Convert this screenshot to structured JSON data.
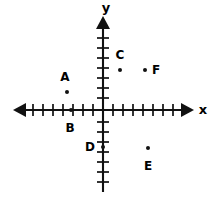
{
  "figure": {
    "type": "coordinate-plane",
    "background_color": "#ffffff",
    "ink_color": "#111111"
  },
  "axes": {
    "x_label": "x",
    "y_label": "y",
    "origin_px": [
      103,
      110
    ],
    "tick_spacing_px": 10,
    "x_range": [
      -8.5,
      9
    ],
    "y_range": [
      -8,
      9.5
    ],
    "grid": false,
    "tick_labels_shown": false,
    "arrowheads": "both-ends-both-axes"
  },
  "chart_data": {
    "type": "scatter",
    "title": "",
    "xlabel": "x",
    "ylabel": "y",
    "xlim": [
      -8.5,
      9
    ],
    "ylim": [
      -8,
      9.5
    ],
    "grid": false,
    "legend": "none",
    "point_labels": [
      "A",
      "B",
      "C",
      "D",
      "E",
      "F"
    ],
    "x": [
      -3.5,
      -3,
      2,
      0,
      4.5,
      4
    ],
    "y": [
      2,
      0,
      4,
      -3.5,
      -4,
      4
    ],
    "points": [
      {
        "label": "A",
        "x": -3.5,
        "y": 2,
        "px": 67,
        "py": 92,
        "label_px": 65,
        "label_py": 77
      },
      {
        "label": "B",
        "x": -3,
        "y": 0,
        "px": 71,
        "py": 110,
        "label_px": 70,
        "label_py": 128
      },
      {
        "label": "C",
        "x": 2,
        "y": 4,
        "px": 120,
        "py": 70,
        "label_px": 120,
        "label_py": 55
      },
      {
        "label": "D",
        "x": 0,
        "y": -3.5,
        "px": 103,
        "py": 147,
        "label_px": 90,
        "label_py": 147
      },
      {
        "label": "E",
        "x": 4.5,
        "y": -4,
        "px": 148,
        "py": 148,
        "label_px": 148,
        "label_py": 166
      },
      {
        "label": "F",
        "x": 4,
        "y": 4,
        "px": 145,
        "py": 70,
        "label_px": 156,
        "label_py": 70
      }
    ]
  },
  "axis_label_positions": {
    "x_label_px": [
      203,
      109
    ],
    "y_label_px": [
      106,
      7
    ]
  }
}
